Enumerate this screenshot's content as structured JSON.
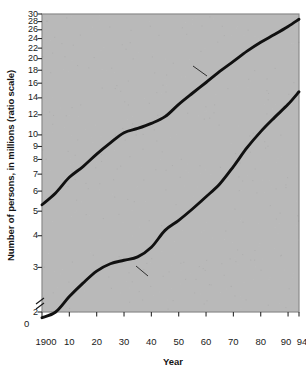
{
  "chart_data": {
    "type": "line",
    "title": "",
    "xlabel": "Year",
    "ylabel": "Number of persons, in millions (ratio scale)",
    "scale": "log",
    "grid": false,
    "legend_position": "inline-annotations",
    "xlim": [
      1900,
      1994
    ],
    "ylim": [
      2,
      30
    ],
    "axis_break": true,
    "zero_label": "0",
    "ytick_labels": [
      "30",
      "28",
      "26",
      "24",
      "22",
      "20",
      "18",
      "16",
      "14",
      "12",
      "10",
      "9",
      "8",
      "7",
      "6",
      "5",
      "4",
      "3",
      "2"
    ],
    "ytick_values": [
      30,
      28,
      26,
      24,
      22,
      20,
      18,
      16,
      14,
      12,
      10,
      9,
      8,
      7,
      6,
      5,
      4,
      3,
      2
    ],
    "xtick_labels": [
      "1900",
      "10",
      "20",
      "30",
      "40",
      "50",
      "60",
      "70",
      "80",
      "90",
      "94"
    ],
    "xtick_values": [
      1900,
      1910,
      1920,
      1930,
      1940,
      1950,
      1960,
      1970,
      1980,
      1990,
      1994
    ],
    "annotations": [
      {
        "text": "Total population",
        "series": "Total population"
      },
      {
        "text": "Civilian labour force",
        "series": "Civilian labour force"
      }
    ],
    "series": [
      {
        "name": "Total population",
        "x": [
          1900,
          1905,
          1910,
          1915,
          1920,
          1925,
          1930,
          1935,
          1940,
          1945,
          1950,
          1955,
          1960,
          1965,
          1970,
          1975,
          1980,
          1985,
          1990,
          1994
        ],
        "values": [
          5.3,
          5.9,
          6.8,
          7.5,
          8.4,
          9.3,
          10.2,
          10.6,
          11.1,
          11.8,
          13.2,
          14.6,
          16.1,
          17.8,
          19.5,
          21.4,
          23.2,
          24.9,
          26.8,
          28.6
        ]
      },
      {
        "name": "Civilian labour force",
        "x": [
          1900,
          1905,
          1910,
          1915,
          1920,
          1925,
          1930,
          1935,
          1940,
          1945,
          1950,
          1955,
          1960,
          1965,
          1970,
          1975,
          1980,
          1985,
          1990,
          1994
        ],
        "values": [
          1.9,
          2.0,
          2.3,
          2.6,
          2.9,
          3.1,
          3.2,
          3.3,
          3.6,
          4.2,
          4.6,
          5.1,
          5.7,
          6.4,
          7.5,
          8.9,
          10.3,
          11.7,
          13.2,
          14.8
        ]
      }
    ],
    "colors": {
      "plot_background": "#b9b9b9",
      "line": "#111111",
      "frame": "#8a8a8a",
      "text": "#151515"
    }
  }
}
